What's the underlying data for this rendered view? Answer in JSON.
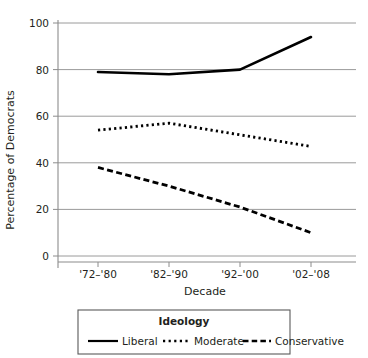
{
  "chart_data": {
    "type": "line",
    "title": "",
    "xlabel": "Decade",
    "ylabel": "Percentage of Democrats",
    "categories": [
      "'72–'80",
      "'82–'90",
      "'92–'00",
      "'02–'08"
    ],
    "ylim": [
      0,
      100
    ],
    "yticks": [
      0,
      20,
      40,
      60,
      80,
      100
    ],
    "ytick_labels": [
      "0",
      "20",
      "40",
      "60",
      "80",
      "100"
    ],
    "grid": "horizontal",
    "legend_position": "below",
    "legend_title": "Ideology",
    "series": [
      {
        "name": "Liberal",
        "style": "solid",
        "color": "#000000",
        "values": [
          79,
          78,
          80,
          94
        ]
      },
      {
        "name": "Moderate",
        "style": "dotted",
        "color": "#000000",
        "values": [
          54,
          57,
          52,
          47
        ]
      },
      {
        "name": "Conservative",
        "style": "dashed",
        "color": "#000000",
        "values": [
          38,
          30,
          21,
          10
        ]
      }
    ]
  },
  "axis": {
    "y_title": "Percentage of Democrats",
    "x_title": "Decade",
    "y_labels": [
      "100",
      "80",
      "60",
      "40",
      "20",
      "0"
    ],
    "x_labels": [
      "'72–'80",
      "'82–'90",
      "'92–'00",
      "'02–'08"
    ]
  },
  "legend": {
    "title": "Ideology",
    "entries": [
      {
        "label": "Liberal",
        "style": "solid"
      },
      {
        "label": "Moderate",
        "style": "dotted"
      },
      {
        "label": "Conservative",
        "style": "dashed"
      }
    ]
  }
}
